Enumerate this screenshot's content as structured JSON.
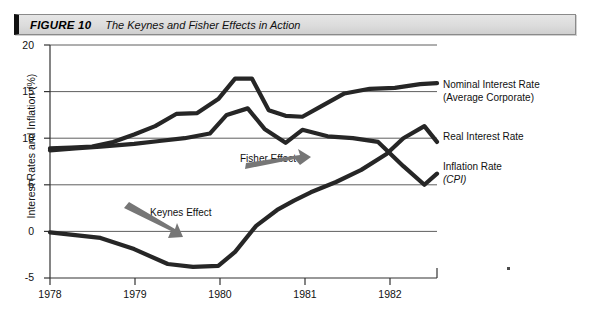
{
  "figure": {
    "label": "FIGURE 10",
    "title": "The Keynes and Fisher Effects in Action"
  },
  "colors": {
    "line": "#262626",
    "arrow": "#767676",
    "grid": "#4d4d4d",
    "axis": "#333333",
    "bar_background": "#dcdcdc",
    "bar_accent": "#111111"
  },
  "chart_data": {
    "type": "line",
    "title": "The Keynes and Fisher Effects in Action",
    "xlabel": "",
    "ylabel": "Interest Rates and Inflation (%)",
    "xlim": [
      1978,
      1982.6
    ],
    "ylim": [
      -5,
      20
    ],
    "yticks": [
      20,
      15,
      10,
      5,
      0,
      -5
    ],
    "xticks": [
      1978,
      1979,
      1980,
      1981,
      1982
    ],
    "xtick_labels": [
      "1978",
      "1979",
      "1980",
      "1981",
      "1982"
    ],
    "ytick_labels": [
      "20",
      "15",
      "10",
      "5",
      "0",
      "-5"
    ],
    "grid": true,
    "legend_position": "right-inline",
    "series": [
      {
        "name": "Nominal Interest Rate (Average Corporate)",
        "label_line1": "Nominal Interest Rate",
        "label_line2": "(Average Corporate)",
        "x": [
          1978.0,
          1978.25,
          1978.5,
          1978.75,
          1979.0,
          1979.25,
          1979.5,
          1979.75,
          1980.0,
          1980.2,
          1980.4,
          1980.6,
          1980.8,
          1981.0,
          1981.2,
          1981.5,
          1981.8,
          1982.1,
          1982.4,
          1982.6
        ],
        "y": [
          8.9,
          9.0,
          9.1,
          9.6,
          10.4,
          11.3,
          12.6,
          12.7,
          14.2,
          16.4,
          16.4,
          13.0,
          12.4,
          12.3,
          13.3,
          14.8,
          15.3,
          15.4,
          15.8,
          15.9
        ]
      },
      {
        "name": "Real Interest Rate",
        "label_line1": "Real Interest Rate",
        "label_line2": "",
        "x": [
          1978.0,
          1978.3,
          1978.6,
          1979.0,
          1979.4,
          1979.7,
          1980.0,
          1980.2,
          1980.45,
          1980.7,
          1980.9,
          1981.1,
          1981.4,
          1981.7,
          1982.0,
          1982.2,
          1982.45,
          1982.6
        ],
        "y": [
          -0.1,
          -0.4,
          -0.7,
          -1.9,
          -3.5,
          -3.8,
          -3.7,
          -2.2,
          0.6,
          2.3,
          3.3,
          4.2,
          5.3,
          6.6,
          8.3,
          10.0,
          11.3,
          9.6
        ]
      },
      {
        "name": "Inflation Rate (CPI)",
        "label_line1": "Inflation Rate",
        "label_line2": "(CPI)",
        "x": [
          1978.0,
          1978.3,
          1978.6,
          1979.0,
          1979.3,
          1979.6,
          1979.9,
          1980.1,
          1980.35,
          1980.55,
          1980.8,
          1981.0,
          1981.3,
          1981.6,
          1981.9,
          1982.2,
          1982.45,
          1982.6
        ],
        "y": [
          8.7,
          8.9,
          9.1,
          9.4,
          9.7,
          10.0,
          10.5,
          12.5,
          13.2,
          11.0,
          9.5,
          10.9,
          10.2,
          10.0,
          9.6,
          7.0,
          5.0,
          6.2
        ]
      }
    ],
    "annotations": [
      {
        "text": "Fisher Effect",
        "x": 1980.55,
        "y": 6.6,
        "arrow": "down-right"
      },
      {
        "text": "Keynes Effect",
        "x": 1979.1,
        "y": 1.6,
        "arrow": "down-right"
      }
    ]
  }
}
